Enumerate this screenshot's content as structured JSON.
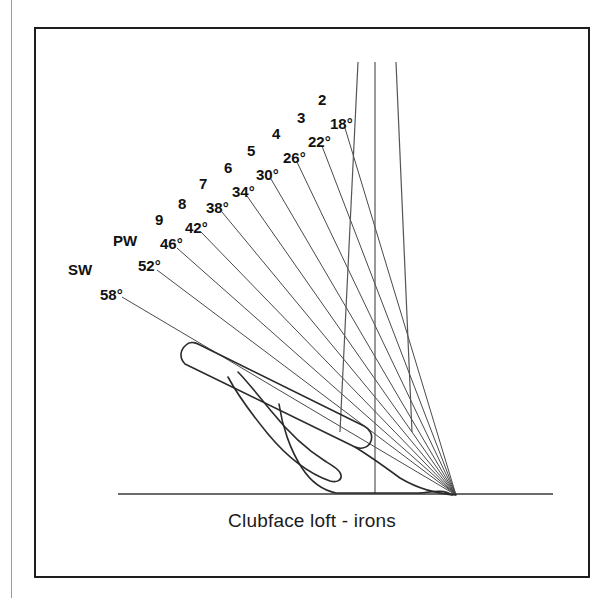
{
  "figure": {
    "caption": "Clubface loft - irons",
    "line_color": "#3a3a3a",
    "border_color": "#1d1d1d",
    "background": "#ffffff",
    "text_color": "#111111"
  },
  "chart_data": {
    "type": "line",
    "title": "Clubface loft - irons",
    "xlabel": "",
    "ylabel": "",
    "units": "degrees",
    "apex": {
      "x": 456,
      "y": 495
    },
    "ground_line": {
      "x1": 118,
      "y1": 494,
      "x2": 553,
      "y2": 494
    },
    "categories": [
      "2",
      "3",
      "4",
      "5",
      "6",
      "7",
      "8",
      "9",
      "PW",
      "SW"
    ],
    "values": [
      18,
      22,
      26,
      30,
      34,
      38,
      42,
      46,
      52,
      58
    ],
    "series": [
      {
        "name": "Clubface loft",
        "values": [
          18,
          22,
          26,
          30,
          34,
          38,
          42,
          46,
          52,
          58
        ]
      }
    ],
    "points": [
      {
        "club": "2",
        "loft": "18°",
        "club_x": 318,
        "club_y": 92,
        "deg_x": 330,
        "deg_y": 116,
        "ray_x": 345,
        "ray_y": 128
      },
      {
        "club": "3",
        "loft": "22°",
        "club_x": 297,
        "club_y": 110,
        "deg_x": 308,
        "deg_y": 134,
        "ray_x": 322,
        "ray_y": 146
      },
      {
        "club": "4",
        "loft": "26°",
        "club_x": 272,
        "club_y": 126,
        "deg_x": 283,
        "deg_y": 150,
        "ray_x": 297,
        "ray_y": 162
      },
      {
        "club": "5",
        "loft": "30°",
        "club_x": 247,
        "club_y": 143,
        "deg_x": 256,
        "deg_y": 167,
        "ray_x": 271,
        "ray_y": 179
      },
      {
        "club": "6",
        "loft": "34°",
        "club_x": 224,
        "club_y": 160,
        "deg_x": 232,
        "deg_y": 184,
        "ray_x": 247,
        "ray_y": 196
      },
      {
        "club": "7",
        "loft": "38°",
        "club_x": 199,
        "club_y": 176,
        "deg_x": 206,
        "deg_y": 200,
        "ray_x": 222,
        "ray_y": 212
      },
      {
        "club": "8",
        "loft": "42°",
        "club_x": 178,
        "club_y": 196,
        "deg_x": 185,
        "deg_y": 220,
        "ray_x": 201,
        "ray_y": 232
      },
      {
        "club": "9",
        "loft": "46°",
        "club_x": 155,
        "club_y": 212,
        "deg_x": 160,
        "deg_y": 236,
        "ray_x": 177,
        "ray_y": 248
      },
      {
        "club": "PW",
        "loft": "52°",
        "club_x": 113,
        "club_y": 233,
        "deg_x": 138,
        "deg_y": 258,
        "ray_x": 157,
        "ray_y": 270
      },
      {
        "club": "SW",
        "loft": "58°",
        "club_x": 68,
        "club_y": 262,
        "deg_x": 100,
        "deg_y": 287,
        "ray_x": 122,
        "ray_y": 297
      }
    ],
    "vertical_reference_lines": [
      {
        "name": "shaft-axis-left",
        "x1": 358,
        "y1": 62,
        "x2": 340,
        "y2": 432
      },
      {
        "name": "shaft-axis-center",
        "x1": 375,
        "y1": 62,
        "x2": 375,
        "y2": 494
      },
      {
        "name": "shaft-axis-right",
        "x1": 396,
        "y1": 62,
        "x2": 412,
        "y2": 432
      }
    ],
    "grid": false,
    "legend": false
  }
}
